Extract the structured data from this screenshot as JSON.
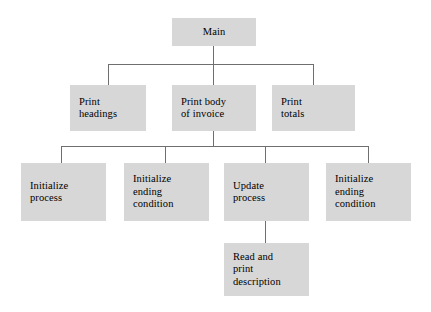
{
  "diagram": {
    "type": "structure-chart",
    "box_fill_color": "#d7d7d7",
    "line_color": "#6f6f6f",
    "background_color": "#ffffff"
  },
  "nodes": {
    "main": {
      "label": "Main",
      "level": 1
    },
    "print_headings": {
      "label": "Print\nheadings",
      "level": 2
    },
    "print_body": {
      "label": "Print body\nof invoice",
      "level": 2
    },
    "print_totals": {
      "label": "Print\ntotals",
      "level": 2
    },
    "initialize_process": {
      "label": "Initialize\nprocess",
      "level": 3
    },
    "initialize_ending_condition_1": {
      "label": "Initialize\nending\ncondition",
      "level": 3
    },
    "update_process": {
      "label": "Update\nprocess",
      "level": 3
    },
    "initialize_ending_condition_2": {
      "label": "Initialize\nending\ncondition",
      "level": 3
    },
    "read_and_print_description": {
      "label": "Read and\nprint\ndescription",
      "level": 4
    }
  }
}
